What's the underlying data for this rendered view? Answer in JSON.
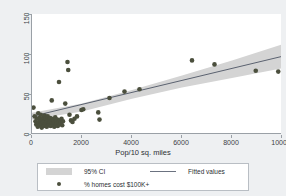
{
  "chart_data": {
    "type": "scatter",
    "title": "",
    "xlabel": "Pop/10 sq. miles",
    "ylabel": "",
    "xlim": [
      0,
      10000
    ],
    "ylim": [
      0,
      150
    ],
    "xticks": [
      0,
      2000,
      4000,
      6000,
      8000,
      10000
    ],
    "xtick_labels": [
      "0",
      "2000",
      "4000",
      "6000",
      "8000",
      "10000"
    ],
    "yticks": [
      0,
      50,
      100,
      150
    ],
    "ytick_labels": [
      "0",
      "50",
      "100",
      "150"
    ],
    "grid": false,
    "legend_position": "below",
    "colors": {
      "marker": "#4b4f3d",
      "fitted_line": "#5b6270",
      "ci_band": "#d4d4d4",
      "plot_background": "#ffffff",
      "figure_background": "#eef0f2",
      "axis": "#9aa0a6",
      "text": "#2b2f33"
    },
    "series": [
      {
        "name": "% homes cost $100K+",
        "type": "scatter",
        "marker": "circle",
        "points": [
          [
            60,
            33
          ],
          [
            110,
            22
          ],
          [
            140,
            16
          ],
          [
            170,
            12
          ],
          [
            200,
            19
          ],
          [
            230,
            9
          ],
          [
            250,
            26
          ],
          [
            270,
            14
          ],
          [
            290,
            20
          ],
          [
            310,
            11
          ],
          [
            330,
            17
          ],
          [
            350,
            24
          ],
          [
            370,
            13
          ],
          [
            390,
            8
          ],
          [
            410,
            18
          ],
          [
            430,
            15
          ],
          [
            450,
            21
          ],
          [
            470,
            10
          ],
          [
            490,
            16
          ],
          [
            510,
            23
          ],
          [
            530,
            12
          ],
          [
            550,
            19
          ],
          [
            570,
            14
          ],
          [
            590,
            9
          ],
          [
            610,
            17
          ],
          [
            630,
            22
          ],
          [
            650,
            13
          ],
          [
            670,
            11
          ],
          [
            690,
            18
          ],
          [
            710,
            15
          ],
          [
            730,
            20
          ],
          [
            750,
            10
          ],
          [
            770,
            16
          ],
          [
            790,
            42
          ],
          [
            810,
            13
          ],
          [
            830,
            19
          ],
          [
            850,
            12
          ],
          [
            870,
            17
          ],
          [
            890,
            9
          ],
          [
            910,
            14
          ],
          [
            930,
            21
          ],
          [
            950,
            11
          ],
          [
            970,
            16
          ],
          [
            990,
            13
          ],
          [
            1010,
            18
          ],
          [
            1030,
            10
          ],
          [
            1060,
            15
          ],
          [
            1090,
            12
          ],
          [
            1120,
            17
          ],
          [
            1150,
            14
          ],
          [
            1180,
            19
          ],
          [
            1210,
            11
          ],
          [
            1240,
            16
          ],
          [
            1080,
            65
          ],
          [
            1330,
            38
          ],
          [
            1420,
            90
          ],
          [
            1450,
            80
          ],
          [
            1500,
            24
          ],
          [
            1560,
            17
          ],
          [
            1620,
            15
          ],
          [
            1700,
            19
          ],
          [
            1800,
            22
          ],
          [
            1980,
            30
          ],
          [
            2050,
            31
          ],
          [
            2650,
            27
          ],
          [
            2700,
            18
          ],
          [
            3100,
            45
          ],
          [
            3700,
            53
          ],
          [
            4300,
            56
          ],
          [
            6400,
            92
          ],
          [
            7300,
            87
          ],
          [
            8950,
            79
          ],
          [
            9850,
            78
          ]
        ]
      },
      {
        "name": "Fitted values",
        "type": "line",
        "points": [
          [
            0,
            22.0
          ],
          [
            10000,
            97.0
          ]
        ]
      },
      {
        "name": "95% CI",
        "type": "area",
        "lower": [
          [
            0,
            18.0
          ],
          [
            2000,
            28.0
          ],
          [
            4000,
            44.0
          ],
          [
            6000,
            58.0
          ],
          [
            8000,
            70.0
          ],
          [
            10000,
            82.0
          ]
        ],
        "upper": [
          [
            0,
            26.5
          ],
          [
            2000,
            38.0
          ],
          [
            4000,
            55.0
          ],
          [
            6000,
            73.0
          ],
          [
            8000,
            92.0
          ],
          [
            10000,
            112.0
          ]
        ]
      }
    ],
    "legend_entries": [
      {
        "label": "95% CI",
        "key": "band"
      },
      {
        "label": "Fitted values",
        "key": "line"
      },
      {
        "label": "% homes cost $100K+",
        "key": "dot"
      }
    ]
  }
}
